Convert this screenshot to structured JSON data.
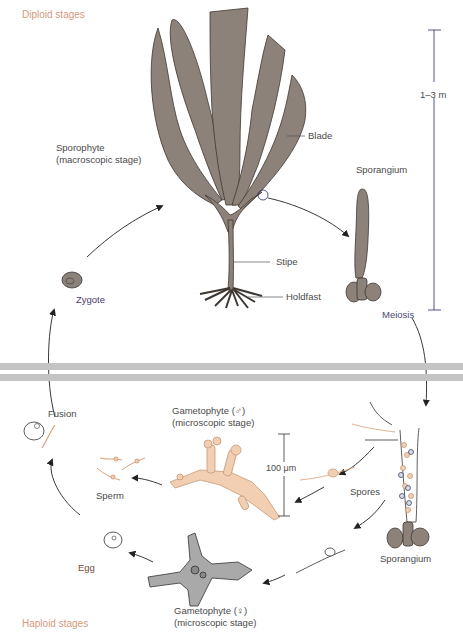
{
  "stages": {
    "diploid": "Diploid stages",
    "haploid": "Haploid stages"
  },
  "labels": {
    "sporophyte_title": "Sporophyte",
    "sporophyte_sub": "(macroscopic stage)",
    "blade": "Blade",
    "stipe": "Stipe",
    "holdfast": "Holdfast",
    "sporangium_top": "Sporangium",
    "meiosis": "Meiosis",
    "scale_large": "1–3 m",
    "zygote": "Zygote",
    "fusion": "Fusion",
    "sperm": "Sperm",
    "egg": "Egg",
    "male_gametophyte_title": "Gametophyte (♂)",
    "male_gametophyte_sub": "(microscopic stage)",
    "scale_small": "100 μm",
    "spores": "Spores",
    "sporangium_bottom": "Sporangium",
    "female_gametophyte_title": "Gametophyte (♀)",
    "female_gametophyte_sub": "(microscopic  stage)"
  },
  "colors": {
    "kelp": "#8d8279",
    "kelp_outline": "#3e3631",
    "male_gametophyte": "#f2cfb2",
    "female_gametophyte": "#a9a9a9",
    "stage_label": "#d49a7a",
    "divider_band": "#c4c4c4"
  }
}
